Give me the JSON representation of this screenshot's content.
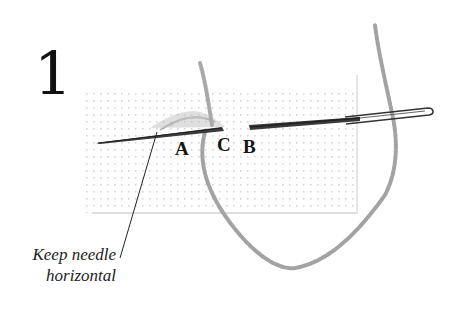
{
  "figure": {
    "step_number": "1",
    "labels": {
      "a": "A",
      "c": "C",
      "b": "B"
    },
    "caption": {
      "line1": "Keep needle",
      "line2": "horizontal"
    }
  },
  "colors": {
    "background": "#ffffff",
    "text": "#111111",
    "needle": "#3a3a3a",
    "yarn": "#a8a8a8",
    "fabric_dots": "#c9c9c9"
  }
}
